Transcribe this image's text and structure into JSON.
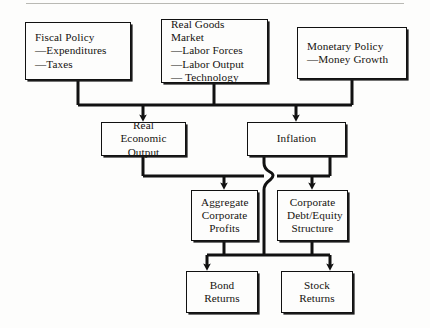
{
  "diagram": {
    "background_color": "#fdfdfc",
    "line_color": "#111111",
    "text_color": "#15130f",
    "nodes": {
      "fiscal_policy": {
        "title": "Fiscal Policy",
        "bullets": [
          "—Expenditures",
          "—Taxes"
        ]
      },
      "real_goods_market": {
        "title": "Real Goods Market",
        "bullets": [
          "—Labor Forces",
          "—Labor Output",
          "— Technology"
        ]
      },
      "monetary_policy": {
        "title": "Monetary Policy",
        "bullets": [
          "—Money Growth"
        ]
      },
      "real_economic_output": {
        "line1": "Real Economic",
        "line2": "Output"
      },
      "inflation": {
        "line1": "Inflation"
      },
      "aggregate_corporate_profits": {
        "line1": "Aggregate",
        "line2": "Corporate",
        "line3": "Profits"
      },
      "corporate_debt_equity_structure": {
        "line1": "Corporate",
        "line2": "Debt/Equity",
        "line3": "Structure"
      },
      "bond_returns": {
        "line1": "Bond",
        "line2": "Returns"
      },
      "stock_returns": {
        "line1": "Stock",
        "line2": "Returns"
      }
    },
    "edges": [
      {
        "from": "fiscal_policy",
        "to": "bus_top"
      },
      {
        "from": "real_goods_market",
        "to": "bus_top"
      },
      {
        "from": "monetary_policy",
        "to": "bus_top"
      },
      {
        "from": "bus_top",
        "to": "real_economic_output",
        "arrow": true
      },
      {
        "from": "bus_top",
        "to": "inflation",
        "arrow": true
      },
      {
        "from": "real_economic_output",
        "to": "bus_middle"
      },
      {
        "from": "inflation",
        "to": "bus_middle"
      },
      {
        "from": "bus_middle",
        "to": "aggregate_corporate_profits",
        "arrow": true
      },
      {
        "from": "bus_middle",
        "to": "corporate_debt_equity_structure",
        "arrow": true
      },
      {
        "from": "inflation",
        "to": "bus_bottom",
        "crosses": "bus_middle"
      },
      {
        "from": "aggregate_corporate_profits",
        "to": "bus_bottom"
      },
      {
        "from": "corporate_debt_equity_structure",
        "to": "bus_bottom"
      },
      {
        "from": "bus_bottom",
        "to": "bond_returns",
        "arrow": true
      },
      {
        "from": "bus_bottom",
        "to": "stock_returns",
        "arrow": true
      }
    ]
  }
}
